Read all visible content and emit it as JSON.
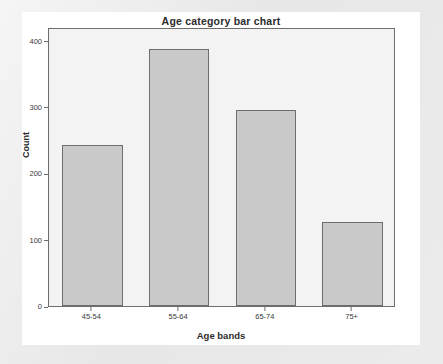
{
  "chart_data": {
    "type": "bar",
    "title": "Age category bar chart",
    "xlabel": "Age bands",
    "ylabel": "Count",
    "categories": [
      "45-54",
      "55-64",
      "65-74",
      "75+"
    ],
    "values": [
      243,
      387,
      295,
      127
    ],
    "ylim": [
      0,
      420
    ],
    "y_ticks": [
      0,
      100,
      200,
      300,
      400
    ],
    "y_tick_labels": [
      "0",
      "100",
      "200",
      "300",
      "400"
    ],
    "grid": false,
    "legend": null,
    "legend_position": "none",
    "colors": {
      "bar_fill": "#c9c9c9",
      "bar_border": "#6d6d6d",
      "plot_background": "#f3f3f3",
      "card_background": "#ffffff",
      "page_background": "#e8e8e8",
      "text": "#2b2b2b"
    }
  }
}
